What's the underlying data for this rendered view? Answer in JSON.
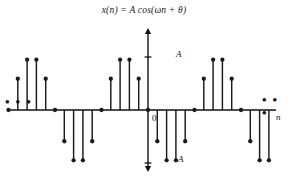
{
  "figure": {
    "title_prefix": "x(n) = A",
    "title_func": "cos(ωn + θ)",
    "title_full": "x(n) = A cos(ωn + θ)",
    "background_color": "#ffffff",
    "ink_color": "#111111",
    "stem_color": "#1a1a1a",
    "width": 288,
    "height": 178
  },
  "axes": {
    "y_label_top": "A",
    "y_label_bottom": "-A",
    "origin_label": "0",
    "x_label": "n",
    "ellipsis_left": "• • •",
    "ellipsis_right": "• • •",
    "baseline_y_px": 110,
    "origin_x_px": 148,
    "amplitude_px": 53,
    "sample_spacing_px": 9.3,
    "arrow_top_y_px": 28,
    "arrow_bottom_y_px": 172,
    "axis_left_x_px": 8,
    "axis_right_x_px": 276
  },
  "chart_data": {
    "type": "line",
    "subtype": "stem",
    "title": "x(n) = A cos(ωn + θ)",
    "xlabel": "n",
    "ylabel": "",
    "grid": false,
    "legend": null,
    "ylim": [
      -1.12,
      1.12
    ],
    "ytick_values": [
      1,
      0,
      -1
    ],
    "ytick_labels": [
      "A",
      "0",
      "-A"
    ],
    "xtick_values": [
      0
    ],
    "xtick_labels": [
      "0"
    ],
    "period_samples": 10,
    "omega_over_2pi": 0.1,
    "phase_description": "theta = pi/2 (cosine shifted so x(0) = 0)",
    "amplitude_label": "A",
    "x": [
      -15,
      -14,
      -13,
      -12,
      -11,
      -10,
      -9,
      -8,
      -7,
      -6,
      -5,
      -4,
      -3,
      -2,
      -1,
      0,
      1,
      2,
      3,
      4,
      5,
      6,
      7,
      8,
      9,
      10,
      11,
      12,
      13,
      14,
      15
    ],
    "values": [
      0.0,
      0.59,
      0.95,
      0.95,
      0.59,
      0.0,
      -0.59,
      -0.95,
      -0.95,
      -0.59,
      0.0,
      0.59,
      0.95,
      0.95,
      0.59,
      0.0,
      -0.59,
      -0.95,
      -0.95,
      -0.59,
      0.0,
      0.59,
      0.95,
      0.95,
      0.59,
      0.0,
      -0.59,
      -0.95,
      -0.95,
      -0.59,
      0.0
    ],
    "units": "fraction of A",
    "annotations": [
      {
        "text": "• • •",
        "position": "left",
        "meaning": "sequence continues to -infinity"
      },
      {
        "text": "• • •",
        "position": "right",
        "meaning": "sequence continues to +infinity"
      }
    ]
  }
}
